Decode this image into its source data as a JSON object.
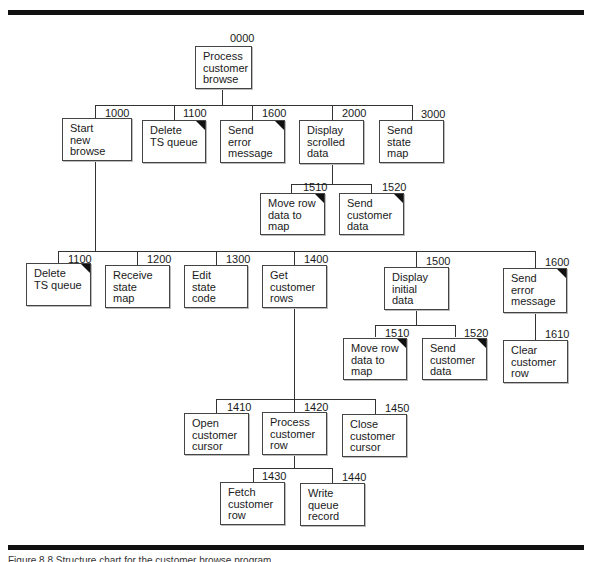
{
  "figure": {
    "caption": "Figure 8.8  Structure chart for the customer browse program",
    "nodes": [
      {
        "id": "0000",
        "label": "Process\ncustomer\nbrowse",
        "common": false
      },
      {
        "id": "1000",
        "label": "Start\nnew\nbrowse",
        "common": false
      },
      {
        "id": "1100",
        "label": "Delete\nTS queue",
        "common": true
      },
      {
        "id": "1600",
        "label": "Send\nerror\nmessage",
        "common": true
      },
      {
        "id": "2000",
        "label": "Display\nscrolled\ndata",
        "common": false
      },
      {
        "id": "3000",
        "label": "Send\nstate\nmap",
        "common": false
      },
      {
        "id": "1510",
        "label": "Move row\ndata to\nmap",
        "common": true
      },
      {
        "id": "1520",
        "label": "Send\ncustomer\ndata",
        "common": true
      },
      {
        "id": "1100",
        "label": "Delete\nTS queue",
        "common": true
      },
      {
        "id": "1200",
        "label": "Receive\nstate\nmap",
        "common": false
      },
      {
        "id": "1300",
        "label": "Edit\nstate\ncode",
        "common": false
      },
      {
        "id": "1400",
        "label": "Get\ncustomer\nrows",
        "common": false
      },
      {
        "id": "1500",
        "label": "Display\ninitial\ndata",
        "common": false
      },
      {
        "id": "1600",
        "label": "Send\nerror\nmessage",
        "common": true
      },
      {
        "id": "1510",
        "label": "Move row\ndata to\nmap",
        "common": true
      },
      {
        "id": "1520",
        "label": "Send\ncustomer\ndata",
        "common": true
      },
      {
        "id": "1610",
        "label": "Clear\ncustomer\nrow",
        "common": false
      },
      {
        "id": "1410",
        "label": "Open\ncustomer\ncursor",
        "common": false
      },
      {
        "id": "1420",
        "label": "Process\ncustomer\nrow",
        "common": false
      },
      {
        "id": "1450",
        "label": "Close\ncustomer\ncursor",
        "common": false
      },
      {
        "id": "1430",
        "label": "Fetch\ncustomer\nrow",
        "common": false
      },
      {
        "id": "1440",
        "label": "Write\nqueue\nrecord",
        "common": false
      }
    ]
  }
}
